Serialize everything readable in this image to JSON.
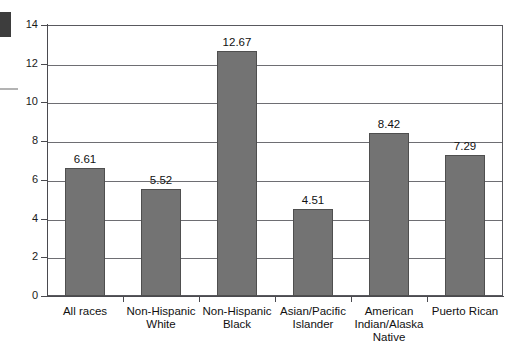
{
  "chart_data": {
    "type": "bar",
    "title": "",
    "subtitle": "",
    "xlabel": "",
    "ylabel": "",
    "ylim": [
      0,
      14
    ],
    "ytick_step": 2,
    "yticks": [
      "0",
      "2",
      "4",
      "6",
      "8",
      "10",
      "12",
      "14"
    ],
    "grid": true,
    "legend": "none",
    "categories": [
      "All races",
      "Non-Hispanic\nWhite",
      "Non-Hispanic\nBlack",
      "Asian/Pacific\nIslander",
      "American\nIndian/Alaska\nNative",
      "Puerto Rican"
    ],
    "values": [
      6.61,
      5.52,
      12.67,
      4.51,
      8.42,
      7.29
    ],
    "value_labels": [
      "6.61",
      "5.52",
      "12.67",
      "4.51",
      "8.42",
      "7.29"
    ],
    "bar_color": "#737373",
    "bar_edge_color": "#4f4f4f",
    "axis_color": "#4a4a4f",
    "grid_color": "#6e6e73",
    "background": "#ffffff"
  }
}
